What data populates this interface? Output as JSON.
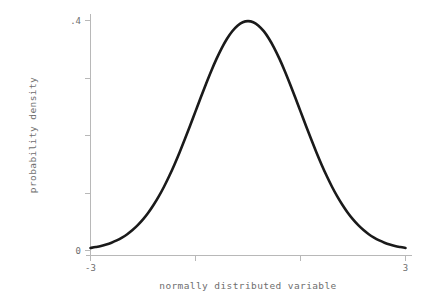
{
  "chart_data": {
    "type": "line",
    "title": "",
    "subtitle": "",
    "xlabel": "normally distributed variable",
    "ylabel": "probability density",
    "xlim": [
      -3,
      3
    ],
    "ylim": [
      0,
      0.4
    ],
    "grid": false,
    "legend": null,
    "legend_position": "none",
    "x_ticks": [
      {
        "value": -3,
        "label": "-3"
      },
      {
        "value": -1,
        "label": ""
      },
      {
        "value": 1,
        "label": ""
      },
      {
        "value": 3,
        "label": "3"
      }
    ],
    "y_ticks": [
      {
        "value": 0,
        "label": "0"
      },
      {
        "value": 0.1,
        "label": ""
      },
      {
        "value": 0.2,
        "label": ""
      },
      {
        "value": 0.3,
        "label": ""
      },
      {
        "value": 0.4,
        "label": ".4"
      }
    ],
    "series": [
      {
        "name": "standard normal density",
        "color": "#1a1a1a",
        "x": [
          -3.0,
          -2.9,
          -2.8,
          -2.7,
          -2.6,
          -2.5,
          -2.4,
          -2.3,
          -2.2,
          -2.1,
          -2.0,
          -1.9,
          -1.8,
          -1.7,
          -1.6,
          -1.5,
          -1.4,
          -1.3,
          -1.2,
          -1.1,
          -1.0,
          -0.9,
          -0.8,
          -0.7,
          -0.6,
          -0.5,
          -0.4,
          -0.3,
          -0.2,
          -0.1,
          0.0,
          0.1,
          0.2,
          0.3,
          0.4,
          0.5,
          0.6,
          0.7,
          0.8,
          0.9,
          1.0,
          1.1,
          1.2,
          1.3,
          1.4,
          1.5,
          1.6,
          1.7,
          1.8,
          1.9,
          2.0,
          2.1,
          2.2,
          2.3,
          2.4,
          2.5,
          2.6,
          2.7,
          2.8,
          2.9,
          3.0
        ],
        "y": [
          0.0044,
          0.006,
          0.0079,
          0.0104,
          0.0136,
          0.0175,
          0.0224,
          0.0283,
          0.0355,
          0.044,
          0.054,
          0.0656,
          0.079,
          0.094,
          0.1109,
          0.1295,
          0.1497,
          0.1714,
          0.1942,
          0.2179,
          0.242,
          0.2661,
          0.2897,
          0.3123,
          0.3332,
          0.3521,
          0.3683,
          0.3814,
          0.391,
          0.397,
          0.3989,
          0.397,
          0.391,
          0.3814,
          0.3683,
          0.3521,
          0.3332,
          0.3123,
          0.2897,
          0.2661,
          0.242,
          0.2179,
          0.1942,
          0.1714,
          0.1497,
          0.1295,
          0.1109,
          0.094,
          0.079,
          0.0656,
          0.054,
          0.044,
          0.0355,
          0.0283,
          0.0224,
          0.0175,
          0.0136,
          0.0104,
          0.0079,
          0.006,
          0.0044
        ]
      }
    ],
    "colors": {
      "curve": "#1a1a1a",
      "axis": "#b8b8b8",
      "text": "#6e6e6e",
      "background": "#ffffff"
    }
  }
}
